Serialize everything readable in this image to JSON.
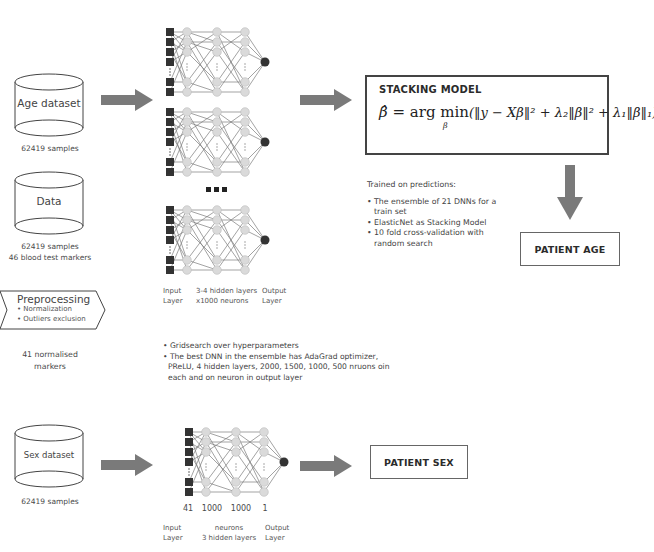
{
  "datasets": {
    "age": {
      "label": "Age dataset",
      "caption": "62419 samples"
    },
    "data": {
      "label": "Data",
      "caption_line1": "62419 samples",
      "caption_line2": "46 blood test markers"
    },
    "sex": {
      "label": "Sex dataset",
      "caption": "62419 samples"
    }
  },
  "preprocessing": {
    "title": "Preprocessing",
    "steps": [
      "• Normalization",
      "• Outliers exclusion"
    ],
    "caption_line1": "41 normalised",
    "caption_line2": "markers"
  },
  "age_network": {
    "ellipsis": "• • •",
    "labels": {
      "input_line1": "Input",
      "input_line2": "Layer",
      "hidden_line1": "3-4 hidden layers",
      "hidden_line2": "x1000 neurons",
      "output_line1": "Output",
      "output_line2": "Layer"
    },
    "notes": [
      "• Gridsearch over hyperparameters",
      "• The best DNN in the ensemble has AdaGrad optimizer,",
      "PReLU, 4 hidden layers, 2000, 1500, 1000, 500 nruons oin",
      "each and on neuron in output layer"
    ]
  },
  "stacking_model": {
    "title": "STACKING MODEL",
    "formula": {
      "lhs": "β̂",
      "eq": "= arg min",
      "sub": "β",
      "body": "(‖y − Xβ‖² + λ₂‖β‖² + λ₁‖β‖₁)"
    },
    "trained_heading": "Trained on predictions:",
    "trained_items": [
      "• The ensemble of 21 DNNs for a train set",
      "• ElasticNet as Stacking Model",
      "• 10 fold cross-validation with random search"
    ]
  },
  "outputs": {
    "age": "PATIENT AGE",
    "sex": "PATIENT SEX"
  },
  "sex_network": {
    "counts": [
      "41",
      "1000",
      "1000",
      "1"
    ],
    "labels": {
      "input_line1": "Input",
      "input_line2": "Layer",
      "hidden_line1": "neurons",
      "hidden_line2": "3 hidden layers",
      "output_line1": "Output",
      "output_line2": "Layer"
    }
  },
  "colors": {
    "arrow": "#7a7a7a",
    "node_fill": "#d9d9d9",
    "input_node": "#333333",
    "output_node": "#333333",
    "edge": "#555555",
    "border": "#444444"
  }
}
